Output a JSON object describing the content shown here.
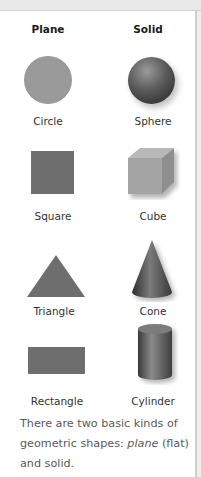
{
  "headers": {
    "plane": "Plane",
    "solid": "Solid"
  },
  "rows": [
    {
      "plane": "Circle",
      "solid": "Sphere"
    },
    {
      "plane": "Square",
      "solid": "Cube"
    },
    {
      "plane": "Triangle",
      "solid": "Cone"
    },
    {
      "plane": "Rectangle",
      "solid": "Cylinder"
    }
  ],
  "caption": {
    "part1": "There are two basic kinds of geometric shapes: ",
    "italic": "plane",
    "part2": " (flat) and solid."
  },
  "colors": {
    "plane_shape": "#7a7a7a",
    "circle": "#9a9a9a",
    "solid_dark": "#3a3a3a",
    "caption_text": "#5a5a5a"
  }
}
